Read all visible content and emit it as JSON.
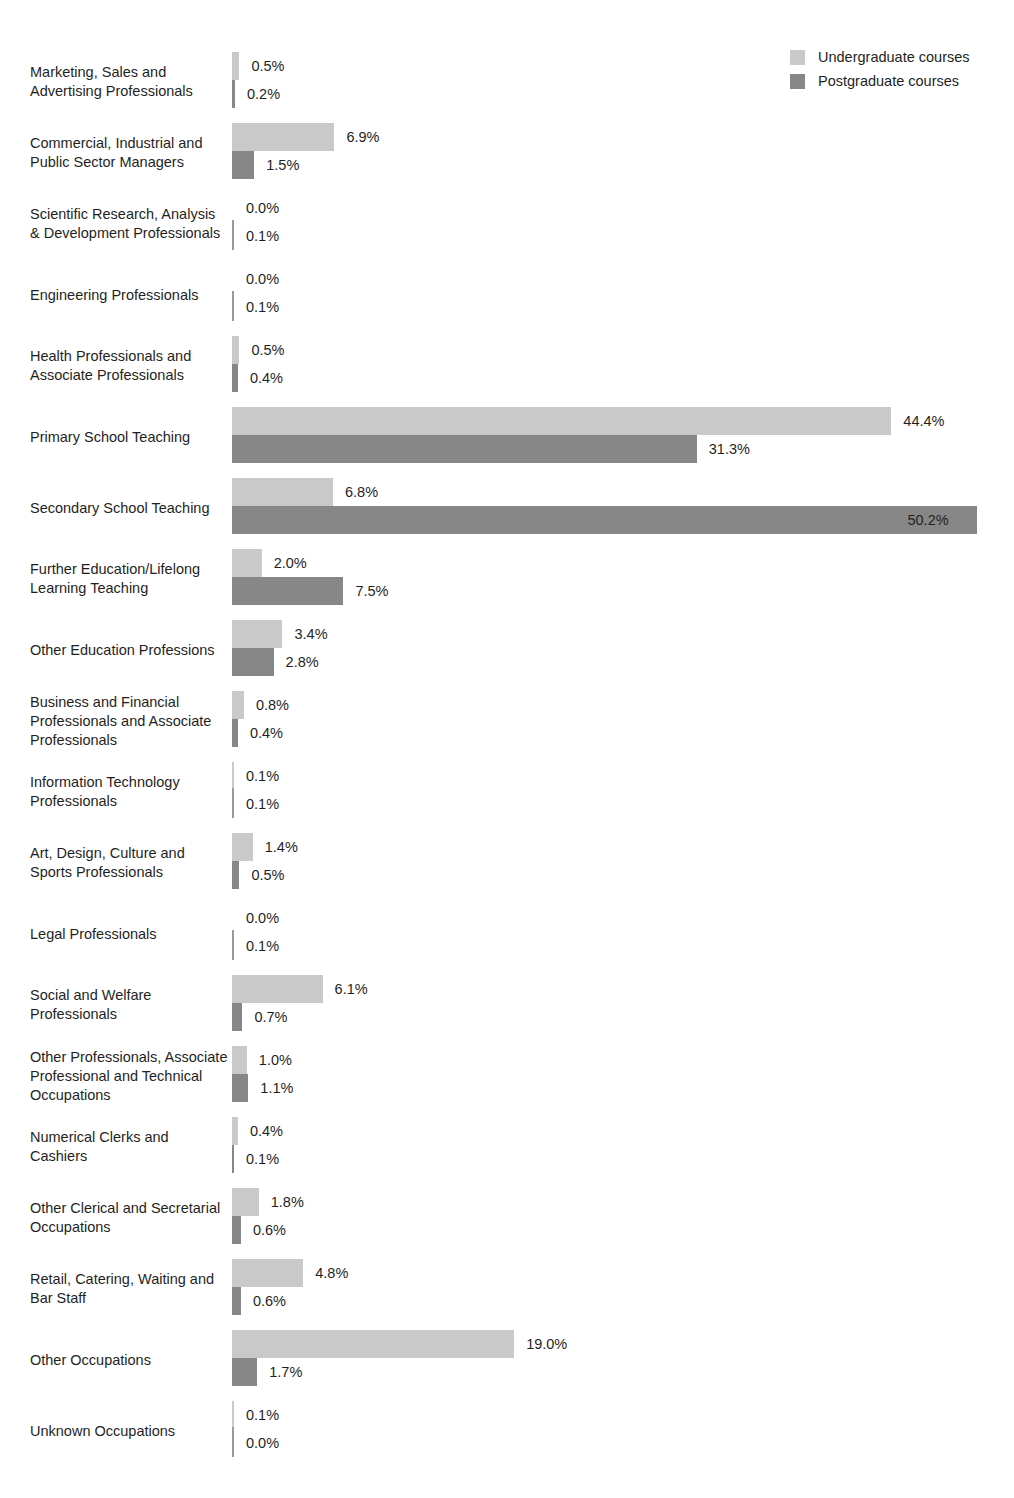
{
  "legend": {
    "position": "top-right",
    "entries": [
      {
        "label": "Undergraduate courses",
        "color": "#c9c9c9",
        "key": "undergraduate"
      },
      {
        "label": "Postgraduate courses",
        "color": "#878787",
        "key": "postgraduate"
      }
    ]
  },
  "chart_data": {
    "type": "bar",
    "orientation": "horizontal",
    "grouped": true,
    "title": "",
    "subtitle": "",
    "xlabel": "",
    "ylabel": "",
    "xlim": [
      0,
      52
    ],
    "grid": false,
    "value_format": "percent_one_decimal",
    "legend_position": "top-right",
    "categories": [
      "Marketing, Sales and Advertising Professionals",
      "Commercial, Industrial and Public Sector Managers",
      "Scientific Research, Analysis & Development Professionals",
      "Engineering Professionals",
      "Health Professionals and Associate Professionals",
      "Primary School Teaching",
      "Secondary School Teaching",
      "Further Education/Lifelong Learning Teaching",
      "Other Education Professions",
      "Business and Financial Professionals and Associate Professionals",
      "Information Technology Professionals",
      "Art, Design, Culture and Sports Professionals",
      "Legal Professionals",
      "Social and Welfare Professionals",
      "Other Professionals, Associate Professional and Technical Occupations",
      "Numerical Clerks and Cashiers",
      "Other Clerical and Secretarial Occupations",
      "Retail, Catering, Waiting and Bar Staff",
      "Other Occupations",
      "Unknown Occupations"
    ],
    "series": [
      {
        "name": "Undergraduate courses",
        "color": "#c9c9c9",
        "values": [
          0.5,
          6.9,
          0.0,
          0.0,
          0.5,
          44.4,
          6.8,
          2.0,
          3.4,
          0.8,
          0.1,
          1.4,
          0.0,
          6.1,
          1.0,
          0.4,
          1.8,
          4.8,
          19.0,
          0.1
        ],
        "labels": [
          "0.5%",
          "6.9%",
          "0.0%",
          "0.0%",
          "0.5%",
          "44.4%",
          "6.8%",
          "2.0%",
          "3.4%",
          "0.8%",
          "0.1%",
          "1.4%",
          "0.0%",
          "6.1%",
          "1.0%",
          "0.4%",
          "1.8%",
          "4.8%",
          "19.0%",
          "0.1%"
        ]
      },
      {
        "name": "Postgraduate courses",
        "color": "#878787",
        "values": [
          0.2,
          1.5,
          0.1,
          0.1,
          0.4,
          31.3,
          50.2,
          7.5,
          2.8,
          0.4,
          0.1,
          0.5,
          0.1,
          0.7,
          1.1,
          0.1,
          0.6,
          0.6,
          1.7,
          0.0
        ],
        "labels": [
          "0.2%",
          "1.5%",
          "0.1%",
          "0.1%",
          "0.4%",
          "31.3%",
          "50.2%",
          "7.5%",
          "2.8%",
          "0.4%",
          "0.1%",
          "0.5%",
          "0.1%",
          "0.7%",
          "1.1%",
          "0.1%",
          "0.6%",
          "0.6%",
          "1.7%",
          "0.0%"
        ]
      }
    ]
  },
  "layout": {
    "bar_area_left_px": 232,
    "px_per_percent": 14.85,
    "bar_height_px": 28,
    "row_pitch_px": 71,
    "first_row_top_px": 52,
    "label_column_width_px": 198
  }
}
